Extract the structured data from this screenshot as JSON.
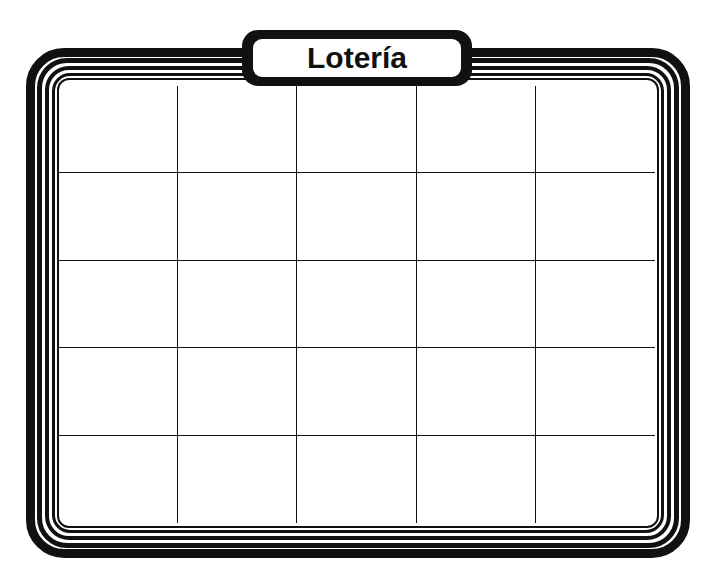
{
  "card": {
    "title": "Lotería",
    "rows": 5,
    "columns": 5,
    "cells": [
      [
        "",
        "",
        "",
        "",
        ""
      ],
      [
        "",
        "",
        "",
        "",
        ""
      ],
      [
        "",
        "",
        "",
        "",
        ""
      ],
      [
        "",
        "",
        "",
        "",
        ""
      ],
      [
        "",
        "",
        "",
        "",
        ""
      ]
    ]
  },
  "colors": {
    "ink": "#111111",
    "paper": "#ffffff"
  }
}
